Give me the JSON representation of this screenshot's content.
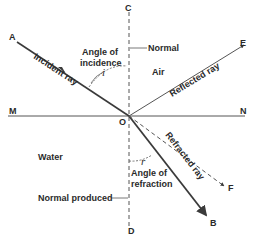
{
  "diagram": {
    "points": {
      "A": "A",
      "C": "C",
      "E": "E",
      "M": "M",
      "N": "N",
      "O": "O",
      "F": "F",
      "B": "B",
      "D": "D"
    },
    "media": {
      "upper": "Air",
      "lower": "Water"
    },
    "labels": {
      "normal": "Normal",
      "normal_produced": "Normal produced",
      "angle_incidence_line1": "Angle of",
      "angle_incidence_line2": "incidence",
      "angle_incidence_symbol": "i",
      "angle_refraction_line1": "Angle of",
      "angle_refraction_line2": "refraction",
      "angle_refraction_symbol": "r",
      "incident_ray": "Incident ray",
      "reflected_ray": "Reflected ray",
      "refracted_ray": "Refracted ray"
    },
    "colors": {
      "line": "#3a3a3a",
      "dashed": "#555555",
      "text": "#2a2a2a"
    }
  }
}
